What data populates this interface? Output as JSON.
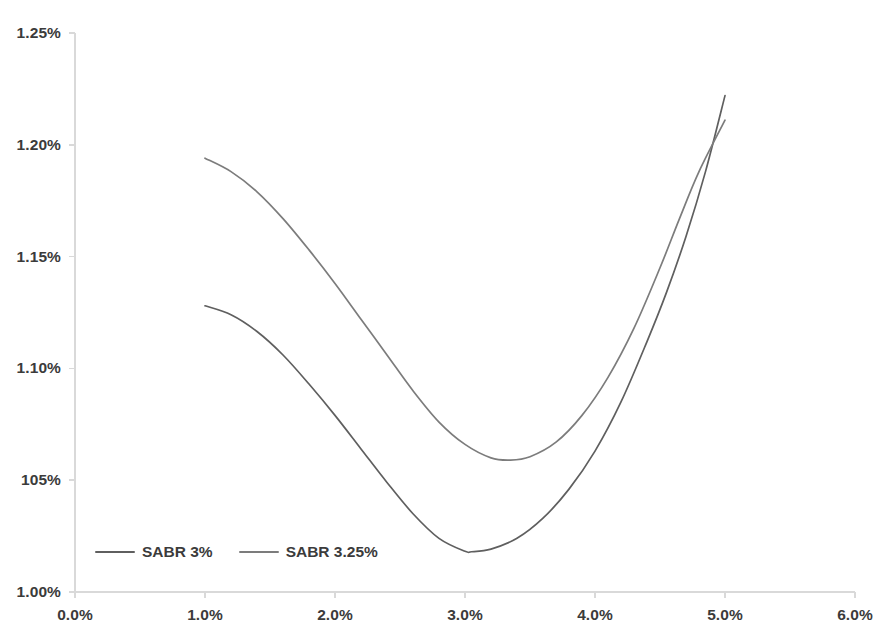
{
  "chart_data": {
    "type": "line",
    "title": "",
    "subtitle": "",
    "xlabel": "",
    "ylabel": "",
    "xlim": [
      0.0,
      6.0
    ],
    "ylim": [
      1.0,
      1.25
    ],
    "grid": false,
    "legend_position": "inside-bottom-left",
    "x_tick_labels": [
      "0.0%",
      "1.0%",
      "2.0%",
      "3.0%",
      "4.0%",
      "5.0%",
      "6.0%"
    ],
    "x_tick_values": [
      0.0,
      1.0,
      2.0,
      3.0,
      4.0,
      5.0,
      6.0
    ],
    "y_tick_labels": [
      "1.25%",
      "1.20%",
      "1.15%",
      "1.10%",
      "105%",
      "1.00%"
    ],
    "y_tick_values": [
      1.25,
      1.2,
      1.15,
      1.1,
      1.05,
      1.0
    ],
    "series": [
      {
        "name": "SABR 3%",
        "color": "#5f5f5f",
        "x": [
          1.0,
          1.2,
          1.4,
          1.6,
          1.8,
          2.0,
          2.2,
          2.4,
          2.6,
          2.8,
          3.0,
          3.05,
          3.2,
          3.4,
          3.6,
          3.8,
          4.0,
          4.2,
          4.4,
          4.55,
          4.7,
          4.85,
          5.0
        ],
        "y": [
          1.128,
          1.124,
          1.1165,
          1.106,
          1.093,
          1.079,
          1.064,
          1.049,
          1.035,
          1.024,
          1.0182,
          1.018,
          1.0192,
          1.024,
          1.033,
          1.046,
          1.063,
          1.085,
          1.112,
          1.134,
          1.159,
          1.188,
          1.222
        ]
      },
      {
        "name": "SABR 3.25%",
        "color": "#7c7c7c",
        "x": [
          1.0,
          1.2,
          1.4,
          1.6,
          1.8,
          2.0,
          2.2,
          2.4,
          2.6,
          2.8,
          3.0,
          3.2,
          3.35,
          3.5,
          3.7,
          3.9,
          4.1,
          4.3,
          4.5,
          4.65,
          4.8,
          5.0
        ],
        "y": [
          1.194,
          1.188,
          1.179,
          1.167,
          1.153,
          1.138,
          1.122,
          1.106,
          1.09,
          1.076,
          1.066,
          1.06,
          1.059,
          1.0605,
          1.067,
          1.079,
          1.096,
          1.118,
          1.145,
          1.167,
          1.188,
          1.211
        ]
      }
    ]
  },
  "legend": {
    "items": [
      {
        "label": "SABR 3%",
        "color": "#5f5f5f"
      },
      {
        "label": "SABR 3.25%",
        "color": "#7c7c7c"
      }
    ]
  },
  "axes": {
    "axis_color": "#d9d9d9",
    "tick_text_color": "#3b3b3b"
  }
}
